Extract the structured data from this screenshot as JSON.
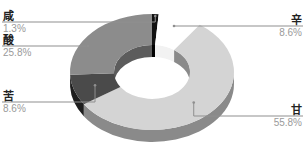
{
  "chart_data": {
    "type": "pie",
    "variant": "donut-3d",
    "title": "",
    "start": "top",
    "direction": "clockwise",
    "slices": [
      {
        "label": "咸",
        "value": 1.3,
        "display": "1.3%",
        "color": "#111111",
        "side_color": "#000000",
        "label_side": "left"
      },
      {
        "label": "辛",
        "value": 8.6,
        "display": "8.6%",
        "color": "#ffffff",
        "side_color": "#f2f2f2",
        "label_side": "right"
      },
      {
        "label": "甘",
        "value": 55.8,
        "display": "55.8%",
        "color": "#d4d4d4",
        "side_color": "#8a8a8a",
        "label_side": "right"
      },
      {
        "label": "苦",
        "value": 8.6,
        "display": "8.6%",
        "color": "#4a4a4a",
        "side_color": "#1e1e1e",
        "label_side": "left"
      },
      {
        "label": "酸",
        "value": 25.8,
        "display": "25.8%",
        "color": "#8c8c8c",
        "side_color": "#5c5c5c",
        "label_side": "left"
      }
    ],
    "legend": "none"
  }
}
